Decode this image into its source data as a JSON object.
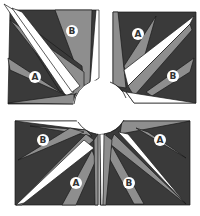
{
  "figure": {
    "title": "",
    "colors": {
      "background": "#ffffff",
      "dark": "#3a3a3a",
      "medium": "#8e8e8e",
      "light": "#ffffff",
      "outline": "#1a1a1a",
      "label_circle": "#ffffff",
      "label_text": "#333333"
    }
  },
  "blocks": [
    {
      "id": "top-left",
      "labels": [
        {
          "text": "B",
          "x": 72,
          "y": 31
        },
        {
          "text": "A",
          "x": 35,
          "y": 77
        }
      ]
    },
    {
      "id": "top-right",
      "labels": [
        {
          "text": "A",
          "x": 138,
          "y": 34
        },
        {
          "text": "B",
          "x": 173,
          "y": 76
        }
      ]
    },
    {
      "id": "bottom-left",
      "labels": [
        {
          "text": "B",
          "x": 43,
          "y": 140
        },
        {
          "text": "A",
          "x": 76,
          "y": 183
        }
      ]
    },
    {
      "id": "bottom-right",
      "labels": [
        {
          "text": "A",
          "x": 160,
          "y": 140
        },
        {
          "text": "B",
          "x": 129,
          "y": 183
        }
      ]
    }
  ]
}
